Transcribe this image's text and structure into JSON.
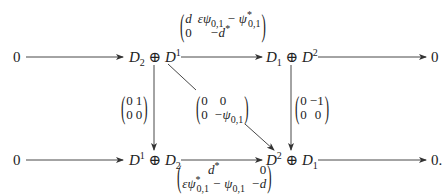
{
  "diagram": {
    "type": "commutative-diagram",
    "top_row": {
      "left_zero": "0",
      "source": {
        "a": "D",
        "a_sub": "2",
        "op": "⊕",
        "b": "D",
        "b_sup": "1"
      },
      "target": {
        "a": "D",
        "a_sub": "1",
        "op": "⊕",
        "b": "D",
        "b_sup": "2"
      },
      "right_zero": "0",
      "map_matrix": {
        "r1c1": "d",
        "r1c2": "εψ",
        "r1c2_sub": "0,1",
        "r1c2_minus": " − ψ",
        "r1c2_sup2": "*",
        "r1c2_sub2": "0,1",
        "r2c1": "0",
        "r2c2": "−d",
        "r2c2_sup": "*"
      }
    },
    "bottom_row": {
      "left_zero": "0",
      "source": {
        "a": "D",
        "a_sup": "1",
        "op": "⊕",
        "b": "D",
        "b_sub": "2"
      },
      "target": {
        "a": "D",
        "a_sup": "2",
        "op": "⊕",
        "b": "D",
        "b_sub": "1"
      },
      "right_zero": "0.",
      "map_matrix": {
        "r1c1": "d",
        "r1c1_sup": "*",
        "r1c2": "0",
        "r2c1": "εψ",
        "r2c1_sup": "*",
        "r2c1_sub": "0,1",
        "r2c1_minus": " − ψ",
        "r2c1_sub2": "0,1",
        "r2c2": "−d"
      }
    },
    "left_vertical_matrix": {
      "r1c1": "0",
      "r1c2": "1",
      "r2c1": "0",
      "r2c2": "0"
    },
    "right_vertical_matrix": {
      "r1c1": "0",
      "r1c2": "−1",
      "r2c1": "0",
      "r2c2": "0"
    },
    "diagonal_matrix": {
      "r1c1": "0",
      "r1c2": "0",
      "r2c1": "0",
      "r2c2": "−ψ",
      "r2c2_sub": "0,1"
    }
  }
}
